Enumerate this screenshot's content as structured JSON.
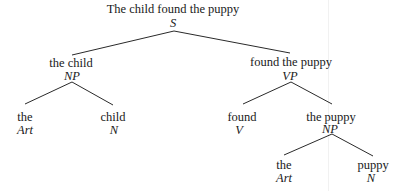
{
  "tree": {
    "root": {
      "words": "The child found the puppy",
      "category": "S"
    },
    "subject": {
      "words": "the child",
      "category": "NP"
    },
    "subject_art": {
      "words": "the",
      "category": "Art"
    },
    "subject_noun": {
      "words": "child",
      "category": "N"
    },
    "predicate": {
      "words": "found the puppy",
      "category": "VP"
    },
    "verb": {
      "words": "found",
      "category": "V"
    },
    "object": {
      "words": "the puppy",
      "category": "NP"
    },
    "object_art": {
      "words": "the",
      "category": "Art"
    },
    "object_noun": {
      "words": "puppy",
      "category": "N"
    }
  },
  "edges": [
    [
      "S",
      "NP(the child)"
    ],
    [
      "S",
      "VP(found the puppy)"
    ],
    [
      "NP(the child)",
      "Art(the)"
    ],
    [
      "NP(the child)",
      "N(child)"
    ],
    [
      "VP(found the puppy)",
      "V(found)"
    ],
    [
      "VP(found the puppy)",
      "NP(the puppy)"
    ],
    [
      "NP(the puppy)",
      "Art(the)"
    ],
    [
      "NP(the puppy)",
      "N(puppy)"
    ]
  ]
}
